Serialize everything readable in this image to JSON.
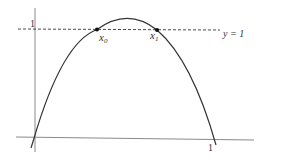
{
  "figure": {
    "y_axis_tick_label": "1",
    "x_axis_tick_label": "1",
    "dashed_line_label": "y = 1",
    "points": [
      {
        "label_base": "x",
        "label_sub": "0"
      },
      {
        "label_base": "x",
        "label_sub": "1"
      }
    ],
    "colors": {
      "curve": "#333333",
      "axes": "#888888",
      "dashed": "#333333",
      "text": "#333333"
    }
  }
}
